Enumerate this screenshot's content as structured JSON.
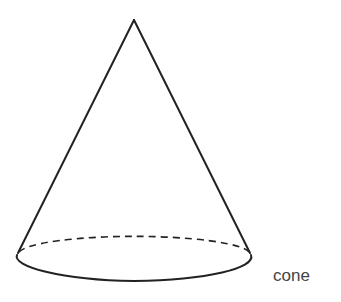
{
  "figure": {
    "shape": "cone",
    "label": "cone",
    "colors": {
      "stroke": "#222222",
      "label": "#444444",
      "background": "#ffffff"
    },
    "geometry": {
      "apex": [
        134,
        20
      ],
      "base_center": [
        134,
        257
      ],
      "base_rx": 117,
      "base_ry": 21,
      "hidden_edge_style": "dashed",
      "visible_edge_style": "solid"
    }
  }
}
